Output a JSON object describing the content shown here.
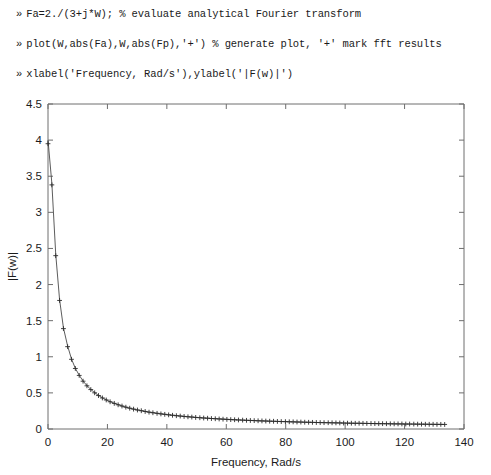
{
  "console": {
    "prompt": "»",
    "lines": [
      "Fa=2./(3+j*W); % evaluate analytical Fourier transform",
      "plot(W,abs(Fa),W,abs(Fp),'+') % generate plot, '+' mark fft results",
      "xlabel('Frequency, Rad/s'),ylabel('|F(w)|')"
    ]
  },
  "chart_data": {
    "type": "line",
    "title": "",
    "xlabel": "Frequency, Rad/s",
    "ylabel": "|F(w)|",
    "xlim": [
      0,
      140
    ],
    "ylim": [
      0,
      4.5
    ],
    "xticks": [
      0,
      20,
      40,
      60,
      80,
      100,
      120,
      140
    ],
    "xticklabels": [
      "0",
      "20",
      "40",
      "60",
      "80",
      "100",
      "120",
      "140"
    ],
    "yticks": [
      0,
      0.5,
      1,
      1.5,
      2,
      2.5,
      3,
      3.5,
      4,
      4.5
    ],
    "yticklabels": [
      "0",
      "0.5",
      "1",
      "1.5",
      "2",
      "2.5",
      "3",
      "3.5",
      "4",
      "4.5"
    ],
    "grid": false,
    "legend": null,
    "series": [
      {
        "name": "abs(Fa) analytical",
        "style": "solid-line",
        "color": "#4a4a4a",
        "x": [
          0,
          1.3,
          2.6,
          3.9,
          5.2,
          6.6,
          7.9,
          9.2,
          10.5,
          11.8,
          13.1,
          14.4,
          15.7,
          17.0,
          18.3,
          19.6,
          20.9,
          22.3,
          23.6,
          24.9,
          26.2,
          27.5,
          28.8,
          30.1,
          31.4,
          32.7,
          34.0,
          35.3,
          36.7,
          38.0,
          39.3,
          40.6,
          41.9,
          43.2,
          44.5,
          45.8,
          47.1,
          48.4,
          49.7,
          51.1,
          52.4,
          53.7,
          55.0,
          56.3,
          57.6,
          58.9,
          60.2,
          61.5,
          62.8,
          64.1,
          65.5,
          66.8,
          68.1,
          69.4,
          70.7,
          72.0,
          73.3,
          74.6,
          75.9,
          77.2,
          78.5,
          79.9,
          81.2,
          82.5,
          83.8,
          85.1,
          86.4,
          87.7,
          89.0,
          90.3,
          91.6,
          92.9,
          94.3,
          95.6,
          96.9,
          98.2,
          99.5,
          100.8,
          102.1,
          103.4,
          104.7,
          106.0,
          107.3,
          108.7,
          110.0,
          111.3,
          112.6,
          113.9,
          115.2,
          116.5,
          117.8,
          119.1,
          120.4,
          121.7,
          123.1,
          124.4,
          125.7,
          127.0,
          128.3,
          129.6,
          130.9,
          132.2,
          133.5
        ],
        "y": [
          4.0,
          3.4,
          2.42,
          1.79,
          1.4,
          1.15,
          0.97,
          0.84,
          0.745,
          0.665,
          0.6,
          0.548,
          0.503,
          0.465,
          0.432,
          0.404,
          0.379,
          0.356,
          0.337,
          0.319,
          0.303,
          0.289,
          0.276,
          0.264,
          0.254,
          0.244,
          0.234,
          0.226,
          0.218,
          0.21,
          0.204,
          0.197,
          0.191,
          0.185,
          0.18,
          0.175,
          0.17,
          0.166,
          0.161,
          0.157,
          0.153,
          0.15,
          0.146,
          0.143,
          0.14,
          0.137,
          0.134,
          0.131,
          0.128,
          0.126,
          0.123,
          0.121,
          0.119,
          0.117,
          0.114,
          0.112,
          0.111,
          0.109,
          0.107,
          0.105,
          0.103,
          0.102,
          0.1,
          0.099,
          0.097,
          0.096,
          0.094,
          0.093,
          0.092,
          0.09,
          0.089,
          0.088,
          0.087,
          0.086,
          0.085,
          0.084,
          0.083,
          0.081,
          0.08,
          0.079,
          0.079,
          0.078,
          0.077,
          0.076,
          0.075,
          0.074,
          0.073,
          0.073,
          0.072,
          0.071,
          0.07,
          0.07,
          0.069,
          0.068,
          0.068,
          0.067,
          0.066,
          0.066,
          0.065,
          0.064,
          0.064,
          0.063,
          0.063
        ]
      },
      {
        "name": "abs(Fp) fft results",
        "style": "plus-markers",
        "color": "#2b2b2b",
        "x": [
          0,
          1.3,
          2.6,
          3.9,
          5.2,
          6.6,
          7.9,
          9.2,
          10.5,
          11.8,
          13.1,
          14.4,
          15.7,
          17.0,
          18.3,
          19.6,
          20.9,
          22.3,
          23.6,
          24.9,
          26.2,
          27.5,
          28.8,
          30.1,
          31.4,
          32.7,
          34.0,
          35.3,
          36.7,
          38.0,
          39.3,
          40.6,
          41.9,
          43.2,
          44.5,
          45.8,
          47.1,
          48.4,
          49.7,
          51.1,
          52.4,
          53.7,
          55.0,
          56.3,
          57.6,
          58.9,
          60.2,
          61.5,
          62.8,
          64.1,
          65.5,
          66.8,
          68.1,
          69.4,
          70.7,
          72.0,
          73.3,
          74.6,
          75.9,
          77.2,
          78.5,
          79.9,
          81.2,
          82.5,
          83.8,
          85.1,
          86.4,
          87.7,
          89.0,
          90.3,
          91.6,
          92.9,
          94.3,
          95.6,
          96.9,
          98.2,
          99.5,
          100.8,
          102.1,
          103.4,
          104.7,
          106.0,
          107.3,
          108.7,
          110.0,
          111.3,
          112.6,
          113.9,
          115.2,
          116.5,
          117.8,
          119.1,
          120.4,
          121.7,
          123.1,
          124.4,
          125.7,
          127.0,
          128.3,
          129.6,
          130.9,
          132.2,
          133.5
        ],
        "y": [
          3.95,
          3.38,
          2.4,
          1.78,
          1.39,
          1.14,
          0.965,
          0.838,
          0.742,
          0.662,
          0.598,
          0.546,
          0.501,
          0.463,
          0.43,
          0.402,
          0.377,
          0.355,
          0.335,
          0.318,
          0.302,
          0.288,
          0.275,
          0.263,
          0.253,
          0.243,
          0.233,
          0.225,
          0.217,
          0.209,
          0.203,
          0.196,
          0.19,
          0.184,
          0.179,
          0.174,
          0.169,
          0.165,
          0.16,
          0.156,
          0.152,
          0.149,
          0.145,
          0.142,
          0.139,
          0.136,
          0.133,
          0.13,
          0.128,
          0.125,
          0.123,
          0.12,
          0.118,
          0.116,
          0.114,
          0.112,
          0.11,
          0.108,
          0.107,
          0.105,
          0.103,
          0.102,
          0.1,
          0.099,
          0.097,
          0.096,
          0.094,
          0.093,
          0.092,
          0.09,
          0.089,
          0.088,
          0.087,
          0.086,
          0.085,
          0.084,
          0.082,
          0.081,
          0.08,
          0.079,
          0.079,
          0.078,
          0.077,
          0.076,
          0.075,
          0.074,
          0.074,
          0.073,
          0.072,
          0.071,
          0.071,
          0.07,
          0.069,
          0.069,
          0.068,
          0.067,
          0.067,
          0.066,
          0.065,
          0.065,
          0.064,
          0.064,
          0.063
        ]
      }
    ]
  }
}
